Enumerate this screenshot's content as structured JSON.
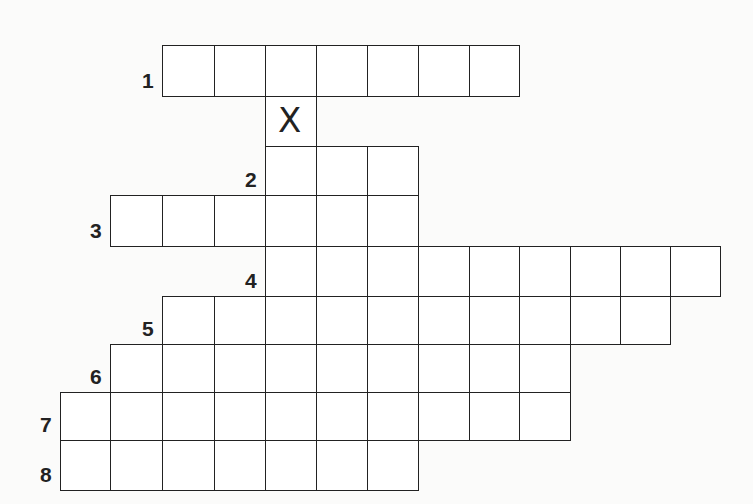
{
  "puzzle": {
    "type": "crossword-grid",
    "columns_x": [
      60,
      110,
      162,
      214,
      265,
      316,
      367,
      418,
      469,
      519,
      570,
      620,
      670,
      720
    ],
    "rows": [
      {
        "label": "1",
        "top": 45,
        "bottom": 96,
        "start_col": 2,
        "cells": 7
      },
      {
        "label": "",
        "top": 96,
        "bottom": 146,
        "start_col": 4,
        "cells": 1,
        "mark": "X"
      },
      {
        "label": "2",
        "top": 146,
        "bottom": 195,
        "start_col": 4,
        "cells": 3
      },
      {
        "label": "3",
        "top": 195,
        "bottom": 246,
        "start_col": 1,
        "cells": 6
      },
      {
        "label": "4",
        "top": 246,
        "bottom": 296,
        "start_col": 4,
        "cells": 9
      },
      {
        "label": "5",
        "top": 296,
        "bottom": 344,
        "start_col": 2,
        "cells": 10
      },
      {
        "label": "6",
        "top": 344,
        "bottom": 392,
        "start_col": 1,
        "cells": 9
      },
      {
        "label": "7",
        "top": 392,
        "bottom": 440,
        "start_col": 0,
        "cells": 10
      },
      {
        "label": "8",
        "top": 440,
        "bottom": 490,
        "start_col": 0,
        "cells": 7
      }
    ],
    "label_color": "#222222",
    "line_color": "#222222"
  }
}
